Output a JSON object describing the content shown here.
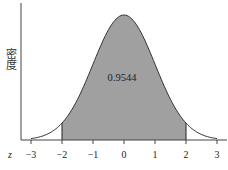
{
  "chart_data": {
    "type": "area",
    "title": "",
    "distribution": {
      "name": "standard normal",
      "mean": 0,
      "sd": 1
    },
    "xlabel": "z",
    "ylabel": "密度",
    "x_ticks": [
      -3,
      -2,
      -1,
      0,
      1,
      2,
      3
    ],
    "x_tick_labels": [
      "−3",
      "−2",
      "−1",
      "0",
      "1",
      "2",
      "3"
    ],
    "xlim": [
      -3.3,
      3.3
    ],
    "shaded_region": {
      "from": -2,
      "to": 2,
      "area": 0.9544
    },
    "annotation": "0.9544",
    "grid": false,
    "legend": null,
    "colors": {
      "fill": "#a0a0a0",
      "line": "#333333",
      "axis": "#444444"
    }
  }
}
